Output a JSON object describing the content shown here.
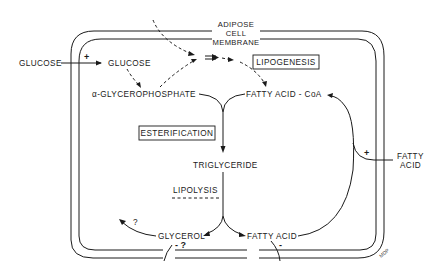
{
  "diagram": {
    "membrane_label": [
      "ADIPOSE",
      "CELL",
      "MEMBRANE"
    ],
    "nodes": {
      "glucose_outside": "GLUCOSE",
      "glucose_inside": "GLUCOSE",
      "alpha_glycerophosphate": "α-GLYCEROPHOSPHATE",
      "fatty_acid_coa": "FATTY ACID - CoA",
      "triglyceride": "TRIGLYCERIDE",
      "glycerol": "GLYCEROL",
      "fatty_acid_inside": "FATTY ACID",
      "fatty_acid_outside_line1": "FATTY",
      "fatty_acid_outside_line2": "ACID"
    },
    "process_boxes": {
      "lipogenesis": "LIPOGENESIS",
      "esterification": "ESTERIFICATION"
    },
    "process_labels": {
      "lipolysis": "LIPOLYSIS"
    },
    "signs": {
      "glucose_uptake": "+",
      "fatty_acid_uptake": "+",
      "glycerol_efflux": "- ?",
      "fatty_acid_efflux": "-",
      "glycerol_fate": "?"
    },
    "signature": "MDP"
  }
}
